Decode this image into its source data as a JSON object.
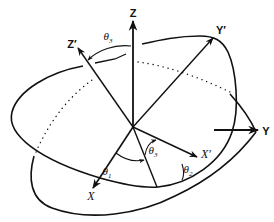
{
  "diagram": {
    "title": "",
    "type": "euler-angle-rotation",
    "colors": {
      "stroke": "#111111",
      "background": "#ffffff"
    },
    "axes": {
      "Z": {
        "label": "Z",
        "x": 133,
        "y": 13
      },
      "Z_prime": {
        "label": "Z′",
        "x": 72,
        "y": 44
      },
      "Y_prime": {
        "label": "Y′",
        "x": 221,
        "y": 30
      },
      "Y": {
        "label": "Y",
        "x": 266,
        "y": 131
      },
      "X": {
        "label": "X",
        "x": 91,
        "y": 196
      },
      "X_prime": {
        "label": "X′",
        "x": 206,
        "y": 154
      }
    },
    "angles": [
      {
        "id": "theta3_top",
        "symbol": "θ",
        "subscript": "3",
        "x": 108,
        "y": 38
      },
      {
        "id": "theta1",
        "symbol": "θ",
        "subscript": "1",
        "x": 107,
        "y": 173
      },
      {
        "id": "theta3_bottom",
        "symbol": "θ",
        "subscript": "3",
        "x": 153,
        "y": 152
      },
      {
        "id": "theta2",
        "symbol": "θ",
        "subscript": "2",
        "x": 188,
        "y": 171
      }
    ]
  }
}
